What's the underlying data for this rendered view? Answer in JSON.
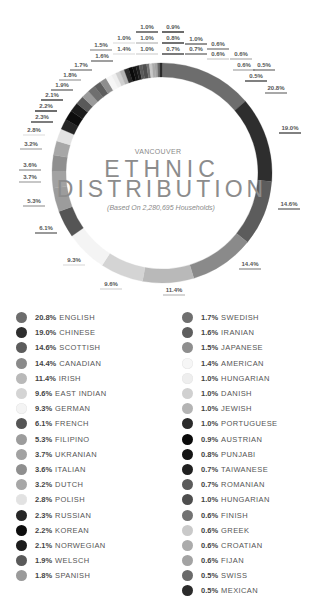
{
  "header": {
    "city": "VANCOUVER",
    "title_line1": "ETHNIC",
    "title_line2": "DISTRIBUTION",
    "subtitle": "(Based On 2,280,695 Households)"
  },
  "chart_data": {
    "type": "pie",
    "variant": "donut",
    "subtitle": "(Based On 2,280,695 Households)",
    "center": [
      162,
      173
    ],
    "outer_radius": 110,
    "inner_radius": 96,
    "start_angle_deg": 0,
    "direction": "clockwise",
    "slices": [
      {
        "label": "ENGLISH",
        "value": 20.8,
        "display": "20.8%",
        "color": "#6d6d6d",
        "lx": 276,
        "ly": 90
      },
      {
        "label": "CHINESE",
        "value": 19.0,
        "display": "19.0%",
        "color": "#2e2e2e",
        "lx": 290,
        "ly": 130
      },
      {
        "label": "SCOTTISH",
        "value": 14.6,
        "display": "14.6%",
        "color": "#5c5c5c",
        "lx": 289,
        "ly": 206
      },
      {
        "label": "CANADIAN",
        "value": 14.4,
        "display": "14.4%",
        "color": "#8a8a8a",
        "lx": 250,
        "ly": 266
      },
      {
        "label": "IRISH",
        "value": 11.4,
        "display": "11.4%",
        "color": "#b9b9b9",
        "lx": 174,
        "ly": 292
      },
      {
        "label": "EAST INDIAN",
        "value": 9.6,
        "display": "9.6%",
        "color": "#d4d4d4",
        "lx": 111,
        "ly": 286
      },
      {
        "label": "GERMAN",
        "value": 9.3,
        "display": "9.3%",
        "color": "#f4f4f4",
        "lx": 74,
        "ly": 262
      },
      {
        "label": "FRENCH",
        "value": 6.1,
        "display": "6.1%",
        "color": "#555555",
        "lx": 46,
        "ly": 230
      },
      {
        "label": "FILIPINO",
        "value": 5.3,
        "display": "5.3%",
        "color": "#9c9c9c",
        "lx": 34,
        "ly": 203
      },
      {
        "label": "UKRANIAN",
        "value": 3.7,
        "display": "3.7%",
        "color": "#a2a2a2",
        "lx": 30,
        "ly": 179
      },
      {
        "label": "ITALIAN",
        "value": 3.6,
        "display": "3.6%",
        "color": "#8f8f8f",
        "lx": 30,
        "ly": 167
      },
      {
        "label": "DUTCH",
        "value": 3.2,
        "display": "3.2%",
        "color": "#a7a7a7",
        "lx": 31,
        "ly": 146
      },
      {
        "label": "POLISH",
        "value": 2.8,
        "display": "2.8%",
        "color": "#e2e2e2",
        "lx": 34,
        "ly": 132
      },
      {
        "label": "RUSSIAN",
        "value": 2.3,
        "display": "2.3%",
        "color": "#262626",
        "lx": 42,
        "ly": 119
      },
      {
        "label": "KOREAN",
        "value": 2.2,
        "display": "2.2%",
        "color": "#0d0d0d",
        "lx": 46,
        "ly": 108
      },
      {
        "label": "NORWEGIAN",
        "value": 2.1,
        "display": "2.1%",
        "color": "#1c1c1c",
        "lx": 52,
        "ly": 97
      },
      {
        "label": "WELSCH",
        "value": 1.9,
        "display": "1.9%",
        "color": "#5a5a5a",
        "lx": 62,
        "ly": 87
      },
      {
        "label": "SPANISH",
        "value": 1.8,
        "display": "1.8%",
        "color": "#9a9a9a",
        "lx": 70,
        "ly": 77
      },
      {
        "label": "SWEDISH",
        "value": 1.7,
        "display": "1.7%",
        "color": "#6f6f6f",
        "lx": 81,
        "ly": 67
      },
      {
        "label": "IRANIAN",
        "value": 1.6,
        "display": "1.6%",
        "color": "#5e5e5e",
        "lx": 102,
        "ly": 58
      },
      {
        "label": "JAPANESE",
        "value": 1.5,
        "display": "1.5%",
        "color": "#8e8e8e",
        "lx": 101,
        "ly": 47
      },
      {
        "label": "AMERICAN",
        "value": 1.4,
        "display": "1.4%",
        "color": "#f6f6f6",
        "lx": 124,
        "ly": 51
      },
      {
        "label": "HUNGARIAN",
        "value": 1.0,
        "display": "1.0%",
        "color": "#eeeeee",
        "lx": 124,
        "ly": 40
      },
      {
        "label": "DANISH",
        "value": 1.0,
        "display": "1.0%",
        "color": "#d0d0d0",
        "lx": 147,
        "ly": 51
      },
      {
        "label": "JEWISH",
        "value": 1.0,
        "display": "1.0%",
        "color": "#b4b4b4",
        "lx": 147,
        "ly": 40
      },
      {
        "label": "PORTUGUESE",
        "value": 1.0,
        "display": "1.0%",
        "color": "#2a2a2a",
        "lx": 147,
        "ly": 29
      },
      {
        "label": "AUSTRIAN",
        "value": 0.9,
        "display": "0.9%",
        "color": "#0a0a0a",
        "lx": 173,
        "ly": 29
      },
      {
        "label": "PUNJABI",
        "value": 0.8,
        "display": "0.8%",
        "color": "#141414",
        "lx": 173,
        "ly": 40
      },
      {
        "label": "TAIWANESE",
        "value": 0.7,
        "display": "0.7%",
        "color": "#202020",
        "lx": 173,
        "ly": 51
      },
      {
        "label": "ROMANIAN",
        "value": 0.7,
        "display": "0.7%",
        "color": "#5b5b5b",
        "lx": 196,
        "ly": 51
      },
      {
        "label": "HUNGARIAN",
        "value": 1.0,
        "display": "1.0%",
        "color": "#4e4e4e",
        "lx": 196,
        "ly": 41
      },
      {
        "label": "FINISH",
        "value": 0.6,
        "display": "0.6%",
        "color": "#727272",
        "lx": 218,
        "ly": 46
      },
      {
        "label": "GREEK",
        "value": 0.6,
        "display": "0.6%",
        "color": "#c9c9c9",
        "lx": 218,
        "ly": 56
      },
      {
        "label": "CROATIAN",
        "value": 0.6,
        "display": "0.6%",
        "color": "#ababab",
        "lx": 241,
        "ly": 56
      },
      {
        "label": "FIJAN",
        "value": 0.6,
        "display": "0.6%",
        "color": "#a3a3a3",
        "lx": 244,
        "ly": 67
      },
      {
        "label": "SWISS",
        "value": 0.5,
        "display": "0.5%",
        "color": "#6a6a6a",
        "lx": 264,
        "ly": 67
      },
      {
        "label": "MEXICAN",
        "value": 0.5,
        "display": "0.5%",
        "color": "#2b2b2b",
        "lx": 256,
        "ly": 78
      }
    ],
    "legend_position": "bottom, two columns"
  },
  "legend": {
    "left": [
      {
        "pct": "20.8%",
        "name": "ENGLISH",
        "color": "#6d6d6d"
      },
      {
        "pct": "19.0%",
        "name": "CHINESE",
        "color": "#2e2e2e"
      },
      {
        "pct": "14.6%",
        "name": "SCOTTISH",
        "color": "#5c5c5c"
      },
      {
        "pct": "14.4%",
        "name": "CANADIAN",
        "color": "#8a8a8a"
      },
      {
        "pct": "11.4%",
        "name": "IRISH",
        "color": "#b9b9b9"
      },
      {
        "pct": "9.6%",
        "name": "EAST INDIAN",
        "color": "#d4d4d4"
      },
      {
        "pct": "9.3%",
        "name": "GERMAN",
        "color": "#f4f4f4"
      },
      {
        "pct": "6.1%",
        "name": "FRENCH",
        "color": "#555555"
      },
      {
        "pct": "5.3%",
        "name": "FILIPINO",
        "color": "#9c9c9c"
      },
      {
        "pct": "3.7%",
        "name": "UKRANIAN",
        "color": "#a2a2a2"
      },
      {
        "pct": "3.6%",
        "name": "ITALIAN",
        "color": "#8f8f8f"
      },
      {
        "pct": "3.2%",
        "name": "DUTCH",
        "color": "#a7a7a7"
      },
      {
        "pct": "2.8%",
        "name": "POLISH",
        "color": "#e2e2e2"
      },
      {
        "pct": "2.3%",
        "name": "RUSSIAN",
        "color": "#262626"
      },
      {
        "pct": "2.2%",
        "name": "KOREAN",
        "color": "#0d0d0d"
      },
      {
        "pct": "2.1%",
        "name": "NORWEGIAN",
        "color": "#1c1c1c"
      },
      {
        "pct": "1.9%",
        "name": "WELSCH",
        "color": "#5a5a5a"
      },
      {
        "pct": "1.8%",
        "name": "SPANISH",
        "color": "#9a9a9a"
      }
    ],
    "right": [
      {
        "pct": "1.7%",
        "name": "SWEDISH",
        "color": "#6f6f6f"
      },
      {
        "pct": "1.6%",
        "name": "IRANIAN",
        "color": "#5e5e5e"
      },
      {
        "pct": "1.5%",
        "name": "JAPANESE",
        "color": "#8e8e8e"
      },
      {
        "pct": "1.4%",
        "name": "AMERICAN",
        "color": "#f6f6f6"
      },
      {
        "pct": "1.0%",
        "name": "HUNGARIAN",
        "color": "#eeeeee"
      },
      {
        "pct": "1.0%",
        "name": "DANISH",
        "color": "#d0d0d0"
      },
      {
        "pct": "1.0%",
        "name": "JEWISH",
        "color": "#b4b4b4"
      },
      {
        "pct": "1.0%",
        "name": "PORTUGUESE",
        "color": "#2a2a2a"
      },
      {
        "pct": "0.9%",
        "name": "AUSTRIAN",
        "color": "#0a0a0a"
      },
      {
        "pct": "0.8%",
        "name": "PUNJABI",
        "color": "#141414"
      },
      {
        "pct": "0.7%",
        "name": "TAIWANESE",
        "color": "#202020"
      },
      {
        "pct": "0.7%",
        "name": "ROMANIAN",
        "color": "#5b5b5b"
      },
      {
        "pct": "1.0%",
        "name": "HUNGARIAN",
        "color": "#4e4e4e"
      },
      {
        "pct": "0.6%",
        "name": "FINISH",
        "color": "#727272"
      },
      {
        "pct": "0.6%",
        "name": "GREEK",
        "color": "#c9c9c9"
      },
      {
        "pct": "0.6%",
        "name": "CROATIAN",
        "color": "#ababab"
      },
      {
        "pct": "0.6%",
        "name": "FIJAN",
        "color": "#a3a3a3"
      },
      {
        "pct": "0.5%",
        "name": "SWISS",
        "color": "#6a6a6a"
      },
      {
        "pct": "0.5%",
        "name": "MEXICAN",
        "color": "#2b2b2b"
      }
    ]
  }
}
